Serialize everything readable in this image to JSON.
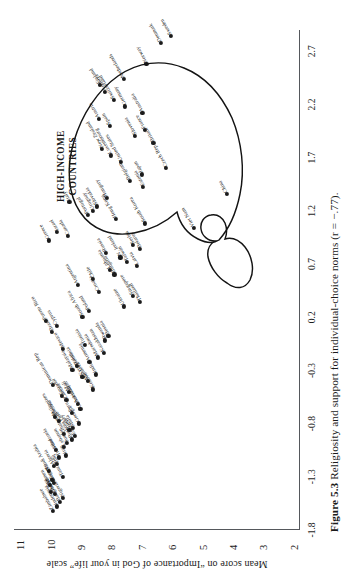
{
  "figure": {
    "number": "Figure 5.3",
    "caption": "Religiosity and support for individual-choice norms (r = −.77).",
    "annotation": [
      "HIGH-INCOME",
      "COUNTRIES"
    ],
    "rotation_note": "page printed sideways"
  },
  "chart_data": {
    "type": "scatter",
    "title": "Religiosity and support for individual-choice norms",
    "xlabel": "",
    "ylabel": "Mean score on “Importance of God in your life” scale",
    "correlation": "r = −.77",
    "xlim": [
      -1.8,
      2.9
    ],
    "ylim": [
      1.8,
      11.2
    ],
    "grid": false,
    "legend": "none",
    "xticks": [
      -1.8,
      -1.3,
      -0.8,
      -0.3,
      0.2,
      0.7,
      1.2,
      1.7,
      2.2,
      2.7
    ],
    "xticklabels": [
      "-1.8",
      "-1.3",
      "-0.8",
      "-0.3",
      "0.2",
      "0.7",
      "1.2",
      "1.7",
      "2.2",
      "2.7"
    ],
    "yticks": [
      11,
      10,
      9,
      8,
      7,
      6,
      5,
      4,
      3,
      2
    ],
    "yticklabels": [
      "11",
      "10",
      "9",
      "8",
      "7",
      "6",
      "5",
      "4",
      "3",
      "2"
    ],
    "points": [
      {
        "label": "Zimbabwe",
        "x": -1.62,
        "y": 9.92
      },
      {
        "label": "Indonesia",
        "x": -1.58,
        "y": 9.8
      },
      {
        "label": "Bangladesh",
        "x": -1.54,
        "y": 9.7
      },
      {
        "label": "Nigeria",
        "x": -1.5,
        "y": 9.58
      },
      {
        "label": "Ghana",
        "x": -1.46,
        "y": 9.86
      },
      {
        "label": "Libya",
        "x": -1.44,
        "y": 9.98
      },
      {
        "label": "Yemen",
        "x": -1.38,
        "y": 10.02
      },
      {
        "label": "Morocco",
        "x": -1.36,
        "y": 9.88
      },
      {
        "label": "Egypt",
        "x": -1.33,
        "y": 9.94
      },
      {
        "label": "Tanzania",
        "x": -1.3,
        "y": 9.6
      },
      {
        "label": "Saudi Arabia",
        "x": -1.25,
        "y": 10.05
      },
      {
        "label": "Algeria",
        "x": -1.2,
        "y": 9.9
      },
      {
        "label": "Iraq",
        "x": -1.18,
        "y": 9.78
      },
      {
        "label": "Trinidad",
        "x": -1.12,
        "y": 9.72
      },
      {
        "label": "Iran",
        "x": -1.1,
        "y": 9.5
      },
      {
        "label": "Venezuela",
        "x": -1.05,
        "y": 9.82
      },
      {
        "label": "Lebanon",
        "x": -1.02,
        "y": 9.55
      },
      {
        "label": "Jordan",
        "x": -0.98,
        "y": 9.45
      },
      {
        "label": "Burkina Faso",
        "x": -0.95,
        "y": 9.3
      },
      {
        "label": "Ethiopia",
        "x": -0.92,
        "y": 9.2
      },
      {
        "label": "Guatemala",
        "x": -0.9,
        "y": 9.55
      },
      {
        "label": "Turkey",
        "x": -0.86,
        "y": 9.38
      },
      {
        "label": "Malta",
        "x": -0.84,
        "y": 9.26
      },
      {
        "label": "Georgia",
        "x": -0.8,
        "y": 9.08
      },
      {
        "label": "Colombia",
        "x": -0.78,
        "y": 9.72
      },
      {
        "label": "Philippines",
        "x": -0.74,
        "y": 9.85
      },
      {
        "label": "Peru",
        "x": -0.7,
        "y": 9.3
      },
      {
        "label": "Uzbekistan",
        "x": -0.66,
        "y": 9.02
      },
      {
        "label": "Azerbaijan",
        "x": -0.62,
        "y": 9.1
      },
      {
        "label": "Zambia",
        "x": -0.58,
        "y": 9.48
      },
      {
        "label": "Ecuador",
        "x": -0.54,
        "y": 9.62
      },
      {
        "label": "Mali",
        "x": -0.5,
        "y": 9.4
      },
      {
        "label": "Kosovo",
        "x": -0.48,
        "y": 8.6
      },
      {
        "label": "Dominican Rep",
        "x": -0.44,
        "y": 9.92
      },
      {
        "label": "Moldova",
        "x": -0.4,
        "y": 8.78
      },
      {
        "label": "Kyrgyzstan",
        "x": -0.36,
        "y": 8.95
      },
      {
        "label": "India",
        "x": -0.34,
        "y": 8.52
      },
      {
        "label": "Malaysia",
        "x": -0.3,
        "y": 9.28
      },
      {
        "label": "Romania",
        "x": -0.26,
        "y": 9.12
      },
      {
        "label": "Armenia",
        "x": -0.22,
        "y": 8.72
      },
      {
        "label": "Macedonia",
        "x": -0.18,
        "y": 8.45
      },
      {
        "label": "Kazakhstan",
        "x": -0.14,
        "y": 8.25
      },
      {
        "label": "Mexico",
        "x": -0.1,
        "y": 9.58
      },
      {
        "label": "Tunisia",
        "x": -0.06,
        "y": 8.88
      },
      {
        "label": "Rwanda",
        "x": -0.02,
        "y": 8.2
      },
      {
        "label": "Bosnia",
        "x": 0.02,
        "y": 8.1
      },
      {
        "label": "Brazil",
        "x": 0.06,
        "y": 9.95
      },
      {
        "label": "Cyprus",
        "x": 0.12,
        "y": 9.8
      },
      {
        "label": "Puerto Rico",
        "x": 0.16,
        "y": 10.15
      },
      {
        "label": "South Africa",
        "x": 0.2,
        "y": 8.95
      },
      {
        "label": "Poland",
        "x": 0.26,
        "y": 8.75
      },
      {
        "label": "Ukraine",
        "x": 0.3,
        "y": 7.6
      },
      {
        "label": "Thailand",
        "x": 0.34,
        "y": 7.05
      },
      {
        "label": "Singapore",
        "x": 0.4,
        "y": 7.3
      },
      {
        "label": "Croatia",
        "x": 0.44,
        "y": 8.42
      },
      {
        "label": "Argentina",
        "x": 0.5,
        "y": 9.1
      },
      {
        "label": "Chile",
        "x": 0.56,
        "y": 8.6
      },
      {
        "label": "Bulgaria",
        "x": 0.6,
        "y": 7.9
      },
      {
        "label": "Lithuania",
        "x": 0.64,
        "y": 8.05
      },
      {
        "label": "Latvia",
        "x": 0.68,
        "y": 7.15
      },
      {
        "label": "Taiwan",
        "x": 0.72,
        "y": 7.48
      },
      {
        "label": "N. Ireland",
        "x": 0.76,
        "y": 7.7
      },
      {
        "label": "Russia",
        "x": 0.8,
        "y": 8.18
      },
      {
        "label": "Belarus",
        "x": 0.84,
        "y": 7.05
      },
      {
        "label": "Serbia",
        "x": 0.88,
        "y": 7.28
      },
      {
        "label": "Greece",
        "x": 0.92,
        "y": 10.05
      },
      {
        "label": "Canada",
        "x": 0.96,
        "y": 9.42
      },
      {
        "label": "Israel",
        "x": 1.0,
        "y": 9.78
      },
      {
        "label": "Viet Nam",
        "x": 1.04,
        "y": 5.3
      },
      {
        "label": "South Korea",
        "x": 1.08,
        "y": 6.9
      },
      {
        "label": "Hong Kong",
        "x": 1.12,
        "y": 7.85
      },
      {
        "label": "Portugal",
        "x": 1.16,
        "y": 8.78
      },
      {
        "label": "Uruguay",
        "x": 1.2,
        "y": 8.6
      },
      {
        "label": "Slovakia",
        "x": 1.24,
        "y": 8.48
      },
      {
        "label": "Italy",
        "x": 1.28,
        "y": 9.38
      },
      {
        "label": "Hungary",
        "x": 1.32,
        "y": 8.15
      },
      {
        "label": "China",
        "x": 1.36,
        "y": 4.2
      },
      {
        "label": "Estonia",
        "x": 1.42,
        "y": 6.95
      },
      {
        "label": "Belgium",
        "x": 1.48,
        "y": 7.4
      },
      {
        "label": "Japan",
        "x": 1.54,
        "y": 7.0
      },
      {
        "label": "Czech Rep",
        "x": 1.6,
        "y": 6.2
      },
      {
        "label": "United States",
        "x": 1.66,
        "y": 7.68
      },
      {
        "label": "Luxembourg",
        "x": 1.72,
        "y": 8.02
      },
      {
        "label": "New Zealand",
        "x": 1.78,
        "y": 8.3
      },
      {
        "label": "Britain",
        "x": 1.84,
        "y": 6.62
      },
      {
        "label": "Slovenia",
        "x": 1.9,
        "y": 7.22
      },
      {
        "label": "France",
        "x": 1.96,
        "y": 6.9
      },
      {
        "label": "Spain",
        "x": 2.0,
        "y": 8.05
      },
      {
        "label": "Austria",
        "x": 2.06,
        "y": 8.42
      },
      {
        "label": "Australia",
        "x": 2.12,
        "y": 6.98
      },
      {
        "label": "Germany",
        "x": 2.18,
        "y": 7.55
      },
      {
        "label": "Switzerland",
        "x": 2.24,
        "y": 7.92
      },
      {
        "label": "Andorra",
        "x": 2.32,
        "y": 8.2
      },
      {
        "label": "Finland",
        "x": 2.38,
        "y": 8.38
      },
      {
        "label": "Netherlands",
        "x": 2.44,
        "y": 7.6
      },
      {
        "label": "Norway",
        "x": 2.58,
        "y": 6.85
      },
      {
        "label": "Denmark",
        "x": 2.78,
        "y": 6.38
      },
      {
        "label": "Sweden",
        "x": 2.84,
        "y": 6.05
      }
    ]
  }
}
